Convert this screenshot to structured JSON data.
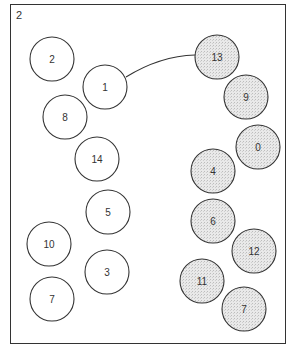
{
  "figure": {
    "corner_label": "2",
    "colors": {
      "unshaded_fill": "#ffffff",
      "shaded_fill": "#e6e6e6",
      "stroke": "#333333"
    },
    "nodes": [
      {
        "label": "2",
        "x": 52,
        "y": 59,
        "shaded": false
      },
      {
        "label": "1",
        "x": 105,
        "y": 87,
        "shaded": false
      },
      {
        "label": "8",
        "x": 65,
        "y": 117,
        "shaded": false
      },
      {
        "label": "14",
        "x": 97,
        "y": 159,
        "shaded": false
      },
      {
        "label": "5",
        "x": 108,
        "y": 212,
        "shaded": false
      },
      {
        "label": "10",
        "x": 49,
        "y": 244,
        "shaded": false
      },
      {
        "label": "3",
        "x": 107,
        "y": 272,
        "shaded": false
      },
      {
        "label": "7",
        "x": 52,
        "y": 299,
        "shaded": false
      },
      {
        "label": "13",
        "x": 217,
        "y": 57,
        "shaded": true
      },
      {
        "label": "9",
        "x": 246,
        "y": 97,
        "shaded": true
      },
      {
        "label": "0",
        "x": 258,
        "y": 147,
        "shaded": true
      },
      {
        "label": "4",
        "x": 213,
        "y": 171,
        "shaded": true
      },
      {
        "label": "6",
        "x": 213,
        "y": 221,
        "shaded": true
      },
      {
        "label": "12",
        "x": 254,
        "y": 251,
        "shaded": true
      },
      {
        "label": "11",
        "x": 202,
        "y": 281,
        "shaded": true
      },
      {
        "label": "7",
        "x": 244,
        "y": 309,
        "shaded": true
      }
    ],
    "edges": [
      {
        "from": "1",
        "to": "13"
      }
    ]
  }
}
